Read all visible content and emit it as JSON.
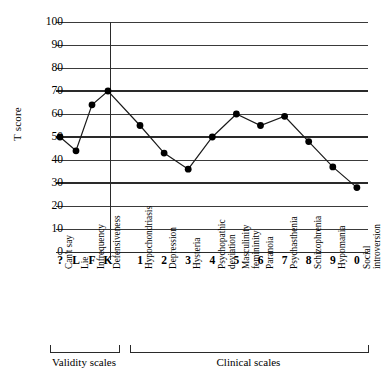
{
  "chart_data": {
    "type": "line",
    "title": "",
    "xlabel": "",
    "ylabel": "T score",
    "ylim": [
      0,
      100
    ],
    "ytick_values": [
      0,
      10,
      20,
      30,
      40,
      50,
      60,
      70,
      80,
      90,
      100
    ],
    "ytick_labels": [
      "0",
      "10",
      "20",
      "30",
      "40",
      "50",
      "60",
      "70",
      "80",
      "90",
      "100"
    ],
    "grid": true,
    "emphasized_gridlines": [
      30,
      50,
      70
    ],
    "legend": "none",
    "categories": [
      "?",
      "L",
      "F",
      "K",
      "1",
      "2",
      "3",
      "4",
      "5",
      "6",
      "7",
      "8",
      "9",
      "0"
    ],
    "category_names": [
      "Can't say",
      "Lie",
      "Infrequency",
      "Defensiveness",
      "Hypochondriasis",
      "Depression",
      "Hysteria",
      "Psychopathic\ndeviation",
      "Masculinity\nfemininity",
      "Paranoia",
      "Psychasthenia",
      "Schizophrenia",
      "Hypomania",
      "Social\nintroversion"
    ],
    "values": [
      50,
      44,
      64,
      70,
      55,
      43,
      36,
      50,
      60,
      55,
      59,
      48,
      37,
      28
    ],
    "groups": [
      {
        "label": "Validity scales",
        "start_index": 0,
        "end_index": 3
      },
      {
        "label": "Clinical scales",
        "start_index": 4,
        "end_index": 13
      }
    ]
  },
  "axis": {
    "y_label": "T score"
  },
  "style": {
    "line_color": "#1a1a1a",
    "marker_color": "#000000",
    "grid_color": "#3a3a3a",
    "grid_major_color": "#2a2a2a",
    "background": "#ffffff"
  }
}
